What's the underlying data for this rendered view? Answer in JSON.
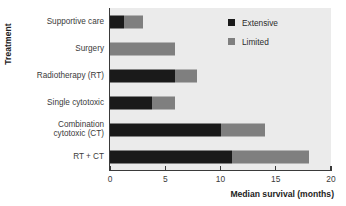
{
  "chart_data": {
    "type": "bar",
    "orientation": "horizontal",
    "stacked": true,
    "title": "",
    "xlabel": "Median survival (months)",
    "ylabel": "Treatment",
    "xlim": [
      0,
      20
    ],
    "xticks": [
      0,
      5,
      10,
      15,
      20
    ],
    "xticklabels": [
      "0",
      "5",
      "10",
      "15",
      "20"
    ],
    "grid": false,
    "legend_position": "top-right",
    "categories": [
      "Supportive care",
      "Surgery",
      "Radiotherapy (RT)",
      "Single cytotoxic",
      "Combination cytotoxic (CT)",
      "RT + CT"
    ],
    "series": [
      {
        "name": "Extensive",
        "color": "#1a1a1a",
        "values": [
          1.3,
          0,
          5.9,
          3.8,
          10.0,
          11.0
        ]
      },
      {
        "name": "Limited",
        "color": "#7f7f7f",
        "values": [
          1.7,
          5.9,
          2.0,
          2.1,
          4.0,
          7.0
        ]
      }
    ],
    "totals": [
      3.0,
      5.9,
      7.9,
      5.9,
      14.0,
      18.0
    ]
  },
  "axes": {
    "y_title": "Treatment",
    "x_title": "Median survival (months)",
    "category_labels": [
      {
        "line1": "Supportive care",
        "line2": ""
      },
      {
        "line1": "Surgery",
        "line2": ""
      },
      {
        "line1": "Radiotherapy (RT)",
        "line2": ""
      },
      {
        "line1": "Single cytotoxic",
        "line2": ""
      },
      {
        "line1": "Combination",
        "line2": "cytotoxic (CT)"
      },
      {
        "line1": "RT + CT",
        "line2": ""
      }
    ],
    "tick_labels": [
      "0",
      "5",
      "10",
      "15",
      "20"
    ]
  },
  "legend": {
    "entries": [
      {
        "label": "Extensive",
        "color": "#1a1a1a",
        "swatch": "square-filled-black"
      },
      {
        "label": "Limited",
        "color": "#7f7f7f",
        "swatch": "square-filled-gray"
      }
    ]
  },
  "colors": {
    "extensive": "#1a1a1a",
    "limited": "#7f7f7f",
    "plot_background": "#ebebeb",
    "figure_background": "#ffffff",
    "axis": "#3a3a3a",
    "text": "#3b3b3b"
  }
}
